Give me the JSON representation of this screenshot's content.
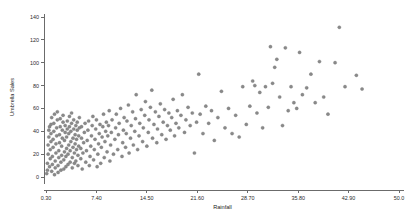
{
  "chart_data": {
    "type": "scatter",
    "title": "",
    "xlabel": "Rainfall",
    "ylabel": "Umbrella Sales",
    "xlim": [
      0.3,
      50.0
    ],
    "ylim": [
      0,
      140
    ],
    "grid": false,
    "legend": null,
    "marker": {
      "shape": "circle",
      "color": "#8a8a8a",
      "size": 2.2
    },
    "xticks": [
      "0.30",
      "7.40",
      "14.50",
      "21.60",
      "28.70",
      "35.80",
      "42.90",
      "50.0"
    ],
    "xtick_values": [
      0.3,
      7.4,
      14.5,
      21.6,
      28.7,
      35.8,
      42.9,
      50.0
    ],
    "yticks": [
      "0",
      "20",
      "40",
      "60",
      "80",
      "100",
      "120",
      "140"
    ],
    "ytick_values": [
      0,
      20,
      40,
      60,
      80,
      100,
      120,
      140
    ],
    "points": [
      [
        0.4,
        3
      ],
      [
        0.5,
        6
      ],
      [
        0.5,
        12
      ],
      [
        0.6,
        20
      ],
      [
        0.6,
        28
      ],
      [
        0.7,
        35
      ],
      [
        0.7,
        41
      ],
      [
        0.8,
        44
      ],
      [
        0.8,
        9
      ],
      [
        0.9,
        16
      ],
      [
        0.9,
        24
      ],
      [
        1.0,
        31
      ],
      [
        1.0,
        38
      ],
      [
        1.0,
        46
      ],
      [
        1.1,
        52
      ],
      [
        1.1,
        5
      ],
      [
        1.2,
        11
      ],
      [
        1.2,
        18
      ],
      [
        1.3,
        26
      ],
      [
        1.3,
        33
      ],
      [
        1.4,
        40
      ],
      [
        1.4,
        47
      ],
      [
        1.5,
        55
      ],
      [
        1.5,
        2
      ],
      [
        1.6,
        8
      ],
      [
        1.6,
        14
      ],
      [
        1.7,
        21
      ],
      [
        1.7,
        29
      ],
      [
        1.8,
        36
      ],
      [
        1.8,
        43
      ],
      [
        1.9,
        50
      ],
      [
        1.9,
        57
      ],
      [
        2.0,
        4
      ],
      [
        2.0,
        10
      ],
      [
        2.1,
        17
      ],
      [
        2.1,
        23
      ],
      [
        2.2,
        30
      ],
      [
        2.2,
        37
      ],
      [
        2.3,
        44
      ],
      [
        2.3,
        51
      ],
      [
        2.4,
        6
      ],
      [
        2.4,
        13
      ],
      [
        2.5,
        19
      ],
      [
        2.5,
        27
      ],
      [
        2.6,
        34
      ],
      [
        2.6,
        41
      ],
      [
        2.7,
        48
      ],
      [
        2.7,
        54
      ],
      [
        2.8,
        7
      ],
      [
        2.8,
        15
      ],
      [
        2.9,
        22
      ],
      [
        2.9,
        32
      ],
      [
        3.0,
        39
      ],
      [
        3.0,
        45
      ],
      [
        3.1,
        9
      ],
      [
        3.1,
        18
      ],
      [
        3.2,
        25
      ],
      [
        3.2,
        35
      ],
      [
        3.3,
        42
      ],
      [
        3.3,
        49
      ],
      [
        3.4,
        11
      ],
      [
        3.4,
        20
      ],
      [
        3.5,
        28
      ],
      [
        3.5,
        38
      ],
      [
        3.6,
        44
      ],
      [
        3.6,
        53
      ],
      [
        3.7,
        13
      ],
      [
        3.7,
        23
      ],
      [
        3.8,
        31
      ],
      [
        3.8,
        40
      ],
      [
        3.9,
        47
      ],
      [
        3.9,
        56
      ],
      [
        4.0,
        8
      ],
      [
        4.0,
        17
      ],
      [
        4.1,
        26
      ],
      [
        4.1,
        34
      ],
      [
        4.2,
        42
      ],
      [
        4.2,
        50
      ],
      [
        4.3,
        12
      ],
      [
        4.3,
        21
      ],
      [
        4.4,
        29
      ],
      [
        4.4,
        37
      ],
      [
        4.5,
        45
      ],
      [
        4.5,
        14
      ],
      [
        4.6,
        24
      ],
      [
        4.6,
        33
      ],
      [
        4.7,
        41
      ],
      [
        4.7,
        48
      ],
      [
        4.8,
        10
      ],
      [
        4.8,
        19
      ],
      [
        4.9,
        27
      ],
      [
        4.9,
        36
      ],
      [
        5.0,
        43
      ],
      [
        5.0,
        52
      ],
      [
        5.2,
        16
      ],
      [
        5.2,
        25
      ],
      [
        5.3,
        34
      ],
      [
        5.3,
        44
      ],
      [
        5.4,
        7
      ],
      [
        5.5,
        21
      ],
      [
        5.6,
        30
      ],
      [
        5.7,
        39
      ],
      [
        5.8,
        47
      ],
      [
        5.9,
        13
      ],
      [
        6.0,
        23
      ],
      [
        6.1,
        32
      ],
      [
        6.2,
        41
      ],
      [
        6.3,
        49
      ],
      [
        6.4,
        10
      ],
      [
        6.5,
        18
      ],
      [
        6.6,
        27
      ],
      [
        6.7,
        36
      ],
      [
        6.8,
        45
      ],
      [
        6.9,
        53
      ],
      [
        7.0,
        15
      ],
      [
        7.1,
        24
      ],
      [
        7.2,
        33
      ],
      [
        7.3,
        42
      ],
      [
        7.4,
        50
      ],
      [
        7.5,
        9
      ],
      [
        7.6,
        20
      ],
      [
        7.7,
        29
      ],
      [
        7.8,
        38
      ],
      [
        7.9,
        46
      ],
      [
        8.0,
        12
      ],
      [
        8.1,
        26
      ],
      [
        8.2,
        35
      ],
      [
        8.3,
        44
      ],
      [
        8.4,
        55
      ],
      [
        8.5,
        17
      ],
      [
        8.6,
        31
      ],
      [
        8.7,
        40
      ],
      [
        8.8,
        48
      ],
      [
        8.9,
        22
      ],
      [
        9.0,
        36
      ],
      [
        9.1,
        45
      ],
      [
        9.2,
        58
      ],
      [
        9.3,
        14
      ],
      [
        9.4,
        28
      ],
      [
        9.5,
        39
      ],
      [
        9.6,
        50
      ],
      [
        9.8,
        20
      ],
      [
        10.0,
        33
      ],
      [
        10.1,
        43
      ],
      [
        10.2,
        55
      ],
      [
        10.4,
        24
      ],
      [
        10.5,
        37
      ],
      [
        10.6,
        47
      ],
      [
        10.8,
        60
      ],
      [
        11.0,
        18
      ],
      [
        11.1,
        30
      ],
      [
        11.2,
        41
      ],
      [
        11.3,
        52
      ],
      [
        11.5,
        26
      ],
      [
        11.6,
        38
      ],
      [
        11.7,
        49
      ],
      [
        11.9,
        63
      ],
      [
        12.0,
        21
      ],
      [
        12.2,
        34
      ],
      [
        12.3,
        45
      ],
      [
        12.5,
        57
      ],
      [
        12.6,
        28
      ],
      [
        12.8,
        40
      ],
      [
        12.9,
        51
      ],
      [
        13.0,
        72
      ],
      [
        13.2,
        24
      ],
      [
        13.4,
        36
      ],
      [
        13.5,
        47
      ],
      [
        13.7,
        59
      ],
      [
        13.9,
        31
      ],
      [
        14.0,
        43
      ],
      [
        14.2,
        54
      ],
      [
        14.3,
        66
      ],
      [
        14.5,
        27
      ],
      [
        14.7,
        39
      ],
      [
        14.8,
        50
      ],
      [
        15.0,
        61
      ],
      [
        15.2,
        76
      ],
      [
        15.3,
        34
      ],
      [
        15.5,
        46
      ],
      [
        15.7,
        57
      ],
      [
        15.9,
        30
      ],
      [
        16.0,
        42
      ],
      [
        16.2,
        53
      ],
      [
        16.4,
        64
      ],
      [
        16.6,
        37
      ],
      [
        16.8,
        48
      ],
      [
        17.0,
        59
      ],
      [
        17.2,
        33
      ],
      [
        17.4,
        45
      ],
      [
        17.6,
        56
      ],
      [
        17.8,
        41
      ],
      [
        18.0,
        52
      ],
      [
        18.2,
        68
      ],
      [
        18.4,
        36
      ],
      [
        18.6,
        47
      ],
      [
        18.8,
        58
      ],
      [
        19.0,
        43
      ],
      [
        19.3,
        54
      ],
      [
        19.5,
        72
      ],
      [
        19.8,
        39
      ],
      [
        20.0,
        50
      ],
      [
        20.3,
        61
      ],
      [
        20.6,
        45
      ],
      [
        20.9,
        56
      ],
      [
        21.2,
        21
      ],
      [
        21.5,
        48
      ],
      [
        21.8,
        90
      ],
      [
        22.0,
        55
      ],
      [
        22.4,
        38
      ],
      [
        22.8,
        62
      ],
      [
        23.2,
        47
      ],
      [
        23.6,
        58
      ],
      [
        24.0,
        32
      ],
      [
        24.5,
        52
      ],
      [
        25.0,
        75
      ],
      [
        25.5,
        43
      ],
      [
        26.0,
        60
      ],
      [
        26.5,
        38
      ],
      [
        27.0,
        54
      ],
      [
        27.5,
        35
      ],
      [
        28.0,
        79
      ],
      [
        28.5,
        46
      ],
      [
        29.0,
        62
      ],
      [
        29.4,
        84
      ],
      [
        29.7,
        80
      ],
      [
        30.0,
        56
      ],
      [
        30.4,
        74
      ],
      [
        30.8,
        43
      ],
      [
        31.2,
        79
      ],
      [
        31.6,
        61
      ],
      [
        31.9,
        114
      ],
      [
        32.2,
        82
      ],
      [
        32.5,
        96
      ],
      [
        32.8,
        103
      ],
      [
        33.2,
        70
      ],
      [
        33.6,
        45
      ],
      [
        34.0,
        113
      ],
      [
        34.4,
        58
      ],
      [
        34.8,
        79
      ],
      [
        35.2,
        65
      ],
      [
        35.6,
        60
      ],
      [
        36.0,
        109
      ],
      [
        36.4,
        72
      ],
      [
        37.0,
        78
      ],
      [
        37.6,
        90
      ],
      [
        38.2,
        65
      ],
      [
        38.8,
        101
      ],
      [
        39.4,
        70
      ],
      [
        40.0,
        55
      ],
      [
        41.0,
        100
      ],
      [
        41.6,
        131
      ],
      [
        42.4,
        79
      ],
      [
        44.0,
        89
      ],
      [
        44.8,
        77
      ]
    ]
  }
}
